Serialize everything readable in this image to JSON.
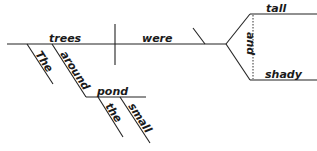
{
  "diagram": {
    "type": "Reed-Kellogg sentence diagram",
    "sentence_parts": {
      "subject": "trees",
      "verb": "were",
      "conjunction": "and",
      "predicate_adjectives": [
        "tall",
        "shady"
      ],
      "subject_modifiers": [
        "The",
        "around"
      ],
      "preposition_object": "pond",
      "object_modifiers": [
        "the",
        "small"
      ]
    },
    "colors": {
      "line": "#222222",
      "text": "#1a1a1a",
      "background": "#ffffff"
    }
  }
}
